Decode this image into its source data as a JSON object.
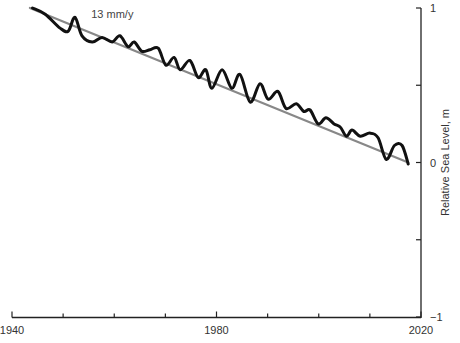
{
  "chart_data": {
    "type": "line",
    "title": "",
    "xlabel": "",
    "ylabel": "Relative Sea Level, m",
    "xlim": [
      1940,
      2020
    ],
    "ylim": [
      -1,
      1
    ],
    "x_ticks": [
      1940,
      1950,
      1960,
      1970,
      1980,
      1990,
      2000,
      2010,
      2020
    ],
    "x_tick_labels": [
      "1940",
      "",
      "",
      "",
      "1980",
      "",
      "",
      "",
      "2020"
    ],
    "y_ticks": [
      1,
      0.5,
      0,
      -0.5,
      -1
    ],
    "y_tick_labels": [
      "1",
      "",
      "0",
      "",
      "−1"
    ],
    "y_axis_position": "right",
    "grid": false,
    "legend": null,
    "annotations": [
      {
        "text": "13 mm/y",
        "x": 1955.5,
        "y": 0.96,
        "refers_to": "Linear trend"
      }
    ],
    "series": [
      {
        "name": "Observed relative sea level",
        "color": "#111111",
        "width": 3,
        "x": [
          1944,
          1946.5,
          1949.4,
          1951,
          1952.3,
          1953.7,
          1955.7,
          1957.6,
          1959.6,
          1961.1,
          1962.7,
          1963.9,
          1965.4,
          1967,
          1968.6,
          1970.1,
          1971.7,
          1972.9,
          1974.8,
          1976.4,
          1977.9,
          1979.1,
          1981.1,
          1983,
          1984.6,
          1986.6,
          1988.5,
          1990.1,
          1992,
          1993.6,
          1995.6,
          1997.1,
          1998.3,
          1999.9,
          2001.4,
          2003,
          2004.2,
          2005.4,
          2006.5,
          2008.1,
          2010,
          2011.6,
          2013.2,
          2014.8,
          2016.3,
          2017.5
        ],
        "values": [
          1.0,
          0.96,
          0.87,
          0.85,
          0.94,
          0.82,
          0.78,
          0.81,
          0.78,
          0.82,
          0.75,
          0.78,
          0.72,
          0.73,
          0.74,
          0.63,
          0.68,
          0.6,
          0.66,
          0.55,
          0.6,
          0.48,
          0.6,
          0.48,
          0.57,
          0.39,
          0.51,
          0.41,
          0.46,
          0.35,
          0.38,
          0.33,
          0.34,
          0.25,
          0.29,
          0.25,
          0.23,
          0.17,
          0.21,
          0.17,
          0.19,
          0.16,
          0.02,
          0.11,
          0.11,
          -0.01
        ]
      },
      {
        "name": "Linear trend",
        "color": "#888888",
        "width": 2,
        "x": [
          1943.5,
          2017.5
        ],
        "values": [
          1.0,
          0.0
        ]
      }
    ]
  }
}
